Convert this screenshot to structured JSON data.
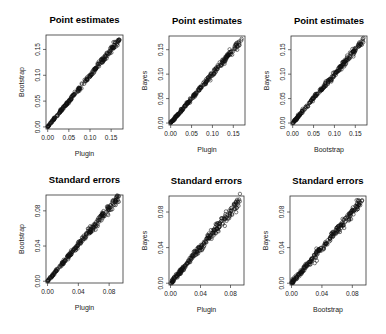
{
  "chart_data": [
    {
      "type": "scatter",
      "title": "Point estimates",
      "xlabel": "Plugin",
      "ylabel": "Bootstrap",
      "xlim": [
        -0.004,
        0.178
      ],
      "ylim": [
        -0.004,
        0.178
      ],
      "xticks": [
        0.0,
        0.05,
        0.1,
        0.15
      ],
      "yticks": [
        0.0,
        0.05,
        0.1,
        0.15
      ],
      "xtick_labels": [
        "0.00",
        "0.05",
        "0.10",
        "0.15"
      ],
      "ytick_labels": [
        "0.00",
        "0.05",
        "0.10",
        "0.15"
      ],
      "grid": false,
      "relationship": "y ≈ x, tight spread, ~300 points from 0.00 to 0.17",
      "spread": 0.0025
    },
    {
      "type": "scatter",
      "title": "Point estimates",
      "xlabel": "Plugin",
      "ylabel": "Bayes",
      "xlim": [
        -0.004,
        0.178
      ],
      "ylim": [
        -0.004,
        0.178
      ],
      "xticks": [
        0.0,
        0.05,
        0.1,
        0.15
      ],
      "yticks": [
        0.0,
        0.05,
        0.1,
        0.15
      ],
      "xtick_labels": [
        "0.00",
        "0.05",
        "0.10",
        "0.15"
      ],
      "ytick_labels": [
        "0.00",
        "0.05",
        "0.10",
        "0.15"
      ],
      "grid": false,
      "relationship": "y ≈ x, tight spread, ~300 points from 0.00 to 0.17",
      "spread": 0.003
    },
    {
      "type": "scatter",
      "title": "Point estimates",
      "xlabel": "Bootstrap",
      "ylabel": "Bayes",
      "xlim": [
        -0.004,
        0.178
      ],
      "ylim": [
        -0.004,
        0.178
      ],
      "xticks": [
        0.0,
        0.05,
        0.1,
        0.15
      ],
      "yticks": [
        0.0,
        0.05,
        0.1,
        0.15
      ],
      "xtick_labels": [
        "0.00",
        "0.05",
        "0.10",
        "0.15"
      ],
      "ytick_labels": [
        "0.00",
        "0.05",
        "0.10",
        "0.15"
      ],
      "grid": false,
      "relationship": "y ≈ x, tight spread, ~300 points from 0.00 to 0.17",
      "spread": 0.003
    },
    {
      "type": "scatter",
      "title": "Standard errors",
      "xlabel": "Plugin",
      "ylabel": "Bootstrap",
      "xlim": [
        -0.002,
        0.098
      ],
      "ylim": [
        -0.002,
        0.098
      ],
      "xticks": [
        0.0,
        0.04,
        0.08
      ],
      "yticks": [
        0.0,
        0.04,
        0.08
      ],
      "xtick_labels": [
        "0.00",
        "0.04",
        "0.08"
      ],
      "ytick_labels": [
        "0.00",
        "0.04",
        "0.08"
      ],
      "grid": false,
      "relationship": "y ≈ 1.05x, moderate spread, ~300 points from 0.00 to 0.09",
      "spread": 0.0022
    },
    {
      "type": "scatter",
      "title": "Standard errors",
      "xlabel": "Plugin",
      "ylabel": "Bayes",
      "xlim": [
        -0.002,
        0.098
      ],
      "ylim": [
        -0.002,
        0.098
      ],
      "xticks": [
        0.0,
        0.04,
        0.08
      ],
      "yticks": [
        0.0,
        0.04,
        0.08
      ],
      "xtick_labels": [
        "0.00",
        "0.04",
        "0.08"
      ],
      "ytick_labels": [
        "0.00",
        "0.04",
        "0.08"
      ],
      "grid": false,
      "relationship": "y ≈ x, moderate spread, ~300 points from 0.00 to 0.095",
      "spread": 0.0028
    },
    {
      "type": "scatter",
      "title": "Standard errors",
      "xlabel": "Bootstrap",
      "ylabel": "Bayes",
      "xlim": [
        -0.002,
        0.098
      ],
      "ylim": [
        -0.002,
        0.098
      ],
      "xticks": [
        0.0,
        0.04,
        0.08
      ],
      "yticks": [
        0.0,
        0.04,
        0.08
      ],
      "xtick_labels": [
        "0.00",
        "0.04",
        "0.08"
      ],
      "ytick_labels": [
        "0.00",
        "0.04",
        "0.08"
      ],
      "grid": false,
      "relationship": "y ≈ x, moderate spread with a few outliers below the line, ~300 points from 0.00 to 0.095",
      "spread": 0.0026
    }
  ],
  "panels": [
    {
      "title": "Point estimates",
      "xlabel": "Plugin",
      "ylabel": "Bootstrap"
    },
    {
      "title": "Point estimates",
      "xlabel": "Plugin",
      "ylabel": "Bayes"
    },
    {
      "title": "Point estimates",
      "xlabel": "Bootstrap",
      "ylabel": "Bayes"
    },
    {
      "title": "Standard errors",
      "xlabel": "Plugin",
      "ylabel": "Bootstrap"
    },
    {
      "title": "Standard errors",
      "xlabel": "Plugin",
      "ylabel": "Bayes"
    },
    {
      "title": "Standard errors",
      "xlabel": "Bootstrap",
      "ylabel": "Bayes"
    }
  ]
}
